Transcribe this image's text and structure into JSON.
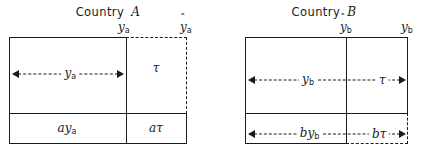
{
  "figure": {
    "type": "economics-box-diagram",
    "panels": [
      {
        "id": "country-a",
        "title_prefix": "Country",
        "title_letter": "A",
        "top_labels": [
          {
            "id": "y-a",
            "text": "y",
            "sub": "a",
            "hat": false
          },
          {
            "id": "yhat-a",
            "text": "y",
            "sub": "a",
            "hat": true
          }
        ],
        "cells": [
          {
            "id": "tau-cell",
            "text": "τ",
            "coefficient": ""
          },
          {
            "id": "ay-a-cell",
            "text": "y",
            "sub": "a",
            "coefficient": "a"
          },
          {
            "id": "atau-cell",
            "text": "τ",
            "coefficient": "a"
          }
        ],
        "dimensions": [
          {
            "id": "y-a-span",
            "label": "y",
            "sub": "a",
            "style": "double-arrow-dashed"
          }
        ]
      },
      {
        "id": "country-b",
        "title_prefix": "Country",
        "title_letter": "B",
        "top_labels": [
          {
            "id": "yhat-b",
            "text": "y",
            "sub": "b",
            "hat": true
          },
          {
            "id": "y-b",
            "text": "y",
            "sub": "b",
            "hat": false
          }
        ],
        "cells": [],
        "dimensions": [
          {
            "id": "y-b-span",
            "label": "y",
            "sub": "b",
            "style": "double-arrow-dashed"
          },
          {
            "id": "tau-span",
            "label": "τ",
            "sub": "",
            "style": "double-arrow-dashed"
          },
          {
            "id": "by-b-span",
            "label": "y",
            "sub": "b",
            "coefficient": "b",
            "style": "double-arrow-dashed"
          },
          {
            "id": "btau-span",
            "label": "τ",
            "sub": "",
            "coefficient": "b",
            "style": "double-arrow-dashed"
          }
        ]
      }
    ],
    "symbols": {
      "hat": "ˆ",
      "tau": "τ"
    },
    "colors": {
      "line": "#1a1a1a",
      "background": "#ffffff"
    }
  }
}
